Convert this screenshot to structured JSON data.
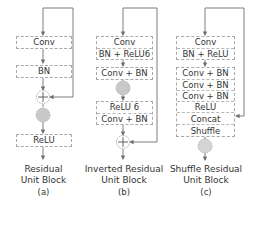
{
  "colors": {
    "line": "#707070",
    "box_border": "#a8a8a8",
    "activation_fill": "#c8c8c8",
    "text": "#333333"
  },
  "panels": [
    {
      "id": "a",
      "blocks": [
        {
          "rows": [
            "Conv"
          ]
        },
        {
          "rows": [
            "BN"
          ]
        },
        {
          "rows": [
            "ReLU"
          ]
        }
      ],
      "nodes": [
        "add-node",
        "activation-node"
      ],
      "caption_line1": "Residual",
      "caption_line2": "Unit Block",
      "sub_label": "(a)"
    },
    {
      "id": "b",
      "blocks": [
        {
          "rows": [
            "Conv",
            "BN + ReLU6"
          ]
        },
        {
          "rows": [
            "Conv + BN"
          ]
        },
        {
          "rows": [
            "ReLU 6",
            "Conv + BN"
          ]
        }
      ],
      "nodes": [
        "activation-node",
        "add-node"
      ],
      "caption_line1": "Inverted Residual",
      "caption_line2": "Unit Block",
      "sub_label": "(b)"
    },
    {
      "id": "c",
      "blocks": [
        {
          "rows": [
            "Conv",
            "BN + ReLU"
          ]
        },
        {
          "rows": [
            "Conv + BN",
            "Conv + BN",
            "Conv + BN",
            "ReLU",
            "Concat",
            "Shuffle"
          ]
        }
      ],
      "nodes": [
        "activation-node"
      ],
      "caption_line1": "Shuffle Residual",
      "caption_line2": "Unit Block",
      "sub_label": "(c)"
    }
  ]
}
